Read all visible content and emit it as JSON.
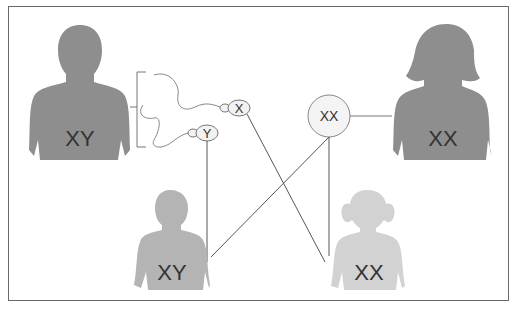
{
  "diagram": {
    "type": "sex-chromosome inheritance",
    "father": {
      "label": "XY",
      "color": "#8e8e8e"
    },
    "mother": {
      "label": "XX",
      "color": "#8e8e8e"
    },
    "son": {
      "label": "XY",
      "color": "#b4b4b4"
    },
    "daughter": {
      "label": "XX",
      "color": "#d2d2d2"
    },
    "sperm": [
      {
        "label": "X"
      },
      {
        "label": "Y"
      }
    ],
    "egg": {
      "label": "XX"
    },
    "line_color": "#555555",
    "text_color": "#333333"
  }
}
